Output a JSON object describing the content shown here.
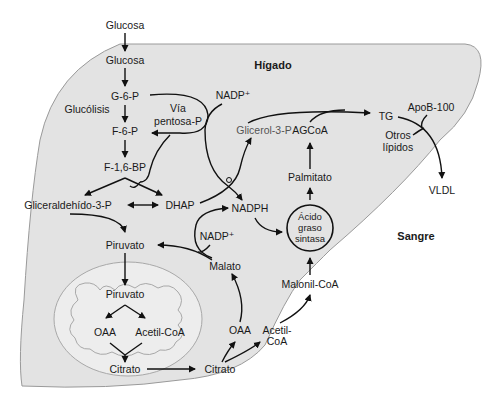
{
  "regions": {
    "liver": "Hígado",
    "blood": "Sangre"
  },
  "colors": {
    "liver_fill": "#e3e3e3",
    "liver_stroke": "#9a9a9a",
    "mito_fill": "#eeeeee",
    "mito_stroke": "#a8a8a8",
    "text": "#1a1a1a",
    "arrow": "#111111"
  },
  "nodes": {
    "glucosa_blood": "Glucosa",
    "glucosa": "Glucosa",
    "g6p": "G-6-P",
    "glucolisis": "Glucólisis",
    "via_pentosa_1": "Vía",
    "via_pentosa_2": "pentosa-P",
    "f6p": "F-6-P",
    "f16bp": "F-1,6-BP",
    "gliceraldehido": "Gliceraldehído-3-P",
    "dhap": "DHAP",
    "nadp_top": "NADP⁺",
    "glicerol3p": "Glicerol-3-P",
    "agcoa": "AGCoA",
    "tg": "TG",
    "apob100": "ApoB-100",
    "otros_1": "Otros",
    "otros_2": "lípidos",
    "vldl": "VLDL",
    "palmitato": "Palmitato",
    "nadph": "NADPH",
    "nadp_mid": "NADP⁺",
    "acido_1": "Ácido",
    "acido_2": "graso",
    "acido_3": "sintasa",
    "piruvato_cyt": "Piruvato",
    "malato": "Malato",
    "malonil": "Malonil-CoA",
    "piruvato_mito": "Piruvato",
    "oaa_mito": "OAA",
    "acetilcoa_mito": "Acetil-CoA",
    "citrato_mito": "Citrato",
    "citrato_cyt": "Citrato",
    "oaa_cyt": "OAA",
    "acetil_cyt_1": "Acetil-",
    "acetil_cyt_2": "CoA"
  }
}
